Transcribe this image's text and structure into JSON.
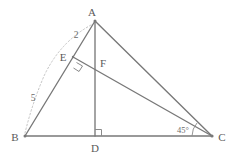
{
  "figure": {
    "type": "geometry-diagram",
    "background_color": "#ffffff",
    "line_color": "#787878",
    "arc_color": "#c4c4c4",
    "text_color": "#5a5a5a"
  },
  "vertices": {
    "a": {
      "label": "A",
      "x": 95,
      "y": 21,
      "label_x": 92,
      "label_y": 16
    },
    "b": {
      "label": "B",
      "x": 25,
      "y": 136,
      "label_x": 13,
      "label_y": 140
    },
    "c": {
      "label": "C",
      "x": 212,
      "y": 136,
      "label_x": 218,
      "label_y": 140
    },
    "d": {
      "label": "D",
      "x": 95,
      "y": 136,
      "label_x": 91,
      "label_y": 150
    },
    "e": {
      "label": "E",
      "x": 73,
      "y": 57,
      "label_x": 59,
      "label_y": 60
    },
    "f": {
      "label": "F",
      "x": 96,
      "y": 72,
      "label_x": 100,
      "label_y": 67
    }
  },
  "segments": [
    {
      "name": "side-ab",
      "from": "a",
      "to": "b"
    },
    {
      "name": "side-ac",
      "from": "a",
      "to": "c"
    },
    {
      "name": "side-bc",
      "from": "b",
      "to": "c"
    },
    {
      "name": "altitude-ad",
      "from": "a",
      "to": "d"
    },
    {
      "name": "cevian-ec",
      "from": "e",
      "to": "c"
    }
  ],
  "measurements": {
    "ae": {
      "text": "2",
      "x": 74,
      "y": 37
    },
    "be": {
      "text": "5",
      "x": 31,
      "y": 100
    }
  },
  "angles": {
    "at_c": {
      "text": "45°",
      "x": 175,
      "y": 133
    },
    "at_e": {
      "text": "right-angle",
      "marker": "square"
    },
    "at_d": {
      "text": "right-angle",
      "marker": "square"
    }
  }
}
